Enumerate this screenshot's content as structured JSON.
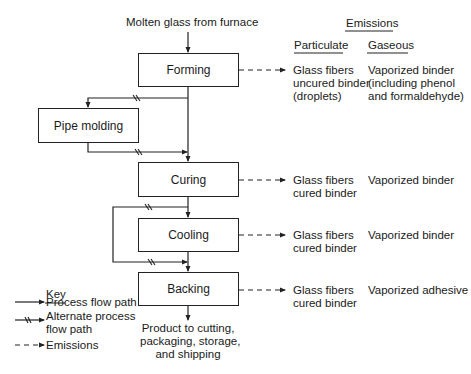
{
  "diagram": {
    "input_label": "Molten glass from furnace",
    "output_label": [
      "Product to cutting,",
      "packaging, storage,",
      "and shipping"
    ],
    "processes": [
      {
        "id": "forming",
        "label": "Forming"
      },
      {
        "id": "pipe_molding",
        "label": "Pipe molding"
      },
      {
        "id": "curing",
        "label": "Curing"
      },
      {
        "id": "cooling",
        "label": "Cooling"
      },
      {
        "id": "backing",
        "label": "Backing"
      }
    ],
    "emissions": {
      "header": "Emissions",
      "particulate_header": "Particulate",
      "gaseous_header": "Gaseous",
      "rows": [
        {
          "process": "forming",
          "particulate": [
            "Glass fibers",
            "uncured binder",
            "(droplets)"
          ],
          "gaseous": [
            "Vaporized binder",
            "(including phenol",
            "and formaldehyde)"
          ]
        },
        {
          "process": "curing",
          "particulate": [
            "Glass fibers",
            "cured binder"
          ],
          "gaseous": [
            "Vaporized binder"
          ]
        },
        {
          "process": "cooling",
          "particulate": [
            "Glass fibers",
            "cured binder"
          ],
          "gaseous": [
            "Vaporized binder"
          ]
        },
        {
          "process": "backing",
          "particulate": [
            "Glass fibers",
            "cured binder"
          ],
          "gaseous": [
            "Vaporized adhesive"
          ]
        }
      ]
    },
    "key": {
      "title": "Key",
      "items": [
        {
          "symbol": "solid-arrow",
          "label": [
            "Process flow path"
          ]
        },
        {
          "symbol": "broken-arrow",
          "label": [
            "Alternate process",
            "flow path"
          ]
        },
        {
          "symbol": "dashed-arrow",
          "label": [
            "Emissions"
          ]
        }
      ]
    }
  }
}
